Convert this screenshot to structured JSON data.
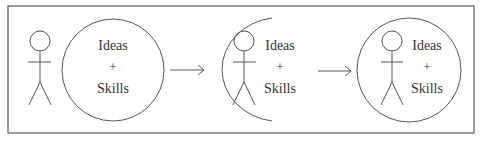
{
  "diagram": {
    "type": "process-flow",
    "panels": [
      {
        "id": "separate",
        "description": "Person standing beside a circle of ideas and skills",
        "container": "full-circle-separate",
        "label": {
          "line1": "Ideas",
          "line2": "+",
          "line3": "Skills"
        }
      },
      {
        "id": "partial",
        "description": "Person partially enclosed by an arc with ideas and skills",
        "container": "open-arc",
        "label": {
          "line1": "Ideas",
          "line2": "+",
          "line3": "Skills"
        }
      },
      {
        "id": "integrated",
        "description": "Person fully inside the circle of ideas and skills",
        "container": "full-circle-enclosing",
        "label": {
          "line1": "Ideas",
          "line2": "+",
          "line3": "Skills"
        }
      }
    ],
    "arrows": [
      {
        "from": "separate",
        "to": "partial"
      },
      {
        "from": "partial",
        "to": "integrated"
      }
    ],
    "colors": {
      "stroke": "#555555",
      "text": "#333333",
      "frame": "#666666",
      "background": "#ffffff"
    }
  }
}
